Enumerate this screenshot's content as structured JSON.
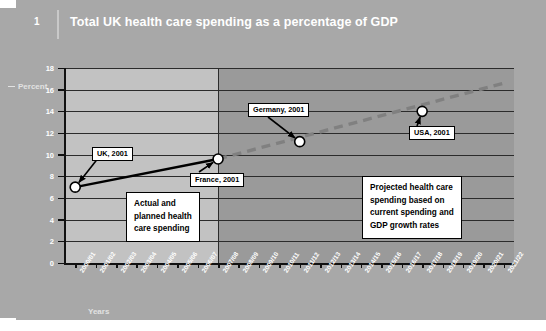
{
  "header": {
    "figure_number": "1",
    "title": "Total UK health care spending as a percentage of GDP"
  },
  "axes": {
    "y_title": "Percent",
    "x_title": "Years"
  },
  "annotations": {
    "uk": "UK, 2001",
    "germany": "Germany, 2001",
    "france": "France, 2001",
    "usa": "USA, 2001",
    "actual_box": [
      "Actual and",
      "planned health",
      "care spending"
    ],
    "projected_box": [
      "Projected health care",
      "spending based on",
      "current spending and",
      "GDP growth rates"
    ]
  },
  "colors": {
    "panel": "#a8a8a8",
    "plot_actual": "#c2c2c2",
    "plot_projected": "#9a9a9a",
    "actual_line": "#000000",
    "projected_line": "#808080",
    "marker_fill": "#ffffff",
    "grid": "#2b2b2b",
    "title_text": "#ffffff"
  },
  "chart_data": {
    "type": "line",
    "title": "Total UK health care spending as a percentage of GDP",
    "xlabel": "Years",
    "ylabel": "Percent",
    "ylim": [
      0,
      18
    ],
    "ytick_step": 2,
    "yticks": [
      0,
      2,
      4,
      6,
      8,
      10,
      12,
      14,
      16,
      18
    ],
    "grid": true,
    "legend": "none",
    "categories": [
      "2000/01",
      "2001/02",
      "2002/03",
      "2003/04",
      "2004/05",
      "2005/06",
      "2006/07",
      "2007/08",
      "2008/09",
      "2009/10",
      "2010/11",
      "2011/12",
      "2012/13",
      "2013/14",
      "2014/15",
      "2015/16",
      "2016/17",
      "2017/18",
      "2018/19",
      "2019/20",
      "2020/21",
      "2021/22"
    ],
    "series": [
      {
        "name": "Actual and planned health care spending",
        "style": "solid",
        "color": "#000000",
        "x": [
          "2000/01",
          "2007/08"
        ],
        "values": [
          7.0,
          9.6
        ]
      },
      {
        "name": "Projected health care spending",
        "style": "dashed",
        "color": "#808080",
        "x": [
          "2007/08",
          "2021/22"
        ],
        "values": [
          9.6,
          16.6
        ]
      }
    ],
    "points": [
      {
        "label": "UK, 2001",
        "x": "2000/01",
        "y": 7.0
      },
      {
        "label": "France, 2001",
        "x": "2007/08",
        "y": 9.6
      },
      {
        "label": "Germany, 2001",
        "x": "2011/12",
        "y": 11.2
      },
      {
        "label": "USA, 2001",
        "x": "2017/18",
        "y": 14.0
      }
    ],
    "split_at": "2007/08",
    "notes": [
      "Actual and planned health care spending",
      "Projected health care spending based on current spending and GDP growth rates"
    ]
  }
}
